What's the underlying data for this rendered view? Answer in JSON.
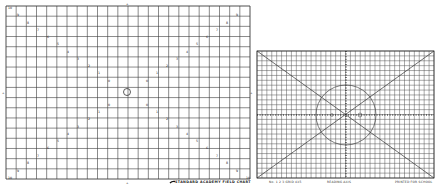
{
  "left_chart": {
    "title": "STANDARD ACADEMY FIELD CHART",
    "grid": {
      "x0": 6,
      "y0": 6,
      "x1": 250,
      "y1": 179,
      "cols": 24,
      "rows": 17
    },
    "line_color": "#3a3a3a",
    "center_marker": {
      "cx": 127,
      "cy": 92,
      "r": 3.5
    },
    "corner_labels": [
      "10",
      "10",
      "10",
      "10"
    ],
    "diagonal_markers": [
      {
        "x": 8,
        "y": 7,
        "t": "10"
      },
      {
        "x": 17,
        "y": 14,
        "t": "9"
      },
      {
        "x": 27,
        "y": 22,
        "t": "8"
      },
      {
        "x": 37,
        "y": 29,
        "t": "7"
      },
      {
        "x": 47,
        "y": 36,
        "t": "6"
      },
      {
        "x": 57,
        "y": 43,
        "t": "5"
      },
      {
        "x": 67,
        "y": 51,
        "t": "4"
      },
      {
        "x": 77,
        "y": 58,
        "t": "3"
      },
      {
        "x": 88,
        "y": 65,
        "t": "2"
      },
      {
        "x": 98,
        "y": 72,
        "t": "1"
      },
      {
        "x": 108,
        "y": 80,
        "t": "0"
      },
      {
        "x": 236,
        "y": 14,
        "t": "9"
      },
      {
        "x": 226,
        "y": 22,
        "t": "8"
      },
      {
        "x": 216,
        "y": 29,
        "t": "7"
      },
      {
        "x": 206,
        "y": 36,
        "t": "6"
      },
      {
        "x": 196,
        "y": 43,
        "t": "5"
      },
      {
        "x": 186,
        "y": 51,
        "t": "4"
      },
      {
        "x": 176,
        "y": 58,
        "t": "3"
      },
      {
        "x": 166,
        "y": 65,
        "t": "2"
      },
      {
        "x": 156,
        "y": 72,
        "t": "1"
      },
      {
        "x": 146,
        "y": 80,
        "t": "0"
      },
      {
        "x": 108,
        "y": 104,
        "t": "0"
      },
      {
        "x": 98,
        "y": 111,
        "t": "1"
      },
      {
        "x": 88,
        "y": 118,
        "t": "2"
      },
      {
        "x": 77,
        "y": 126,
        "t": "3"
      },
      {
        "x": 67,
        "y": 133,
        "t": "4"
      },
      {
        "x": 57,
        "y": 140,
        "t": "5"
      },
      {
        "x": 47,
        "y": 147,
        "t": "6"
      },
      {
        "x": 37,
        "y": 155,
        "t": "7"
      },
      {
        "x": 27,
        "y": 162,
        "t": "8"
      },
      {
        "x": 17,
        "y": 170,
        "t": "9"
      },
      {
        "x": 8,
        "y": 177,
        "t": "10"
      },
      {
        "x": 146,
        "y": 104,
        "t": "0"
      },
      {
        "x": 156,
        "y": 111,
        "t": "1"
      },
      {
        "x": 166,
        "y": 118,
        "t": "2"
      },
      {
        "x": 176,
        "y": 126,
        "t": "3"
      },
      {
        "x": 186,
        "y": 133,
        "t": "4"
      },
      {
        "x": 196,
        "y": 140,
        "t": "5"
      },
      {
        "x": 206,
        "y": 147,
        "t": "6"
      },
      {
        "x": 216,
        "y": 155,
        "t": "7"
      },
      {
        "x": 226,
        "y": 162,
        "t": "8"
      },
      {
        "x": 236,
        "y": 170,
        "t": "9"
      },
      {
        "x": 246,
        "y": 177,
        "t": "10"
      }
    ]
  },
  "right_chart": {
    "grid": {
      "x0": 2,
      "y0": 3,
      "x1": 179,
      "y1": 130,
      "cols": 36,
      "rows": 26
    },
    "line_color": "#555555",
    "center": {
      "cx": 91,
      "cy": 67
    },
    "circle_r": 30,
    "footer_labels": {
      "left": "No. 1 2 3  GRID 4X5",
      "center": "READING AXIS",
      "right": "PRINTED  FOR  SCHOOL"
    }
  }
}
